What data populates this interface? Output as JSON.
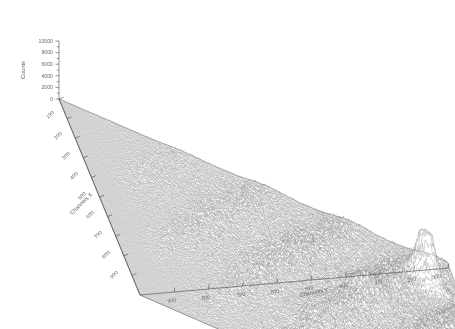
{
  "figure": {
    "kind": "3d-surface-plot",
    "background_color": "#ffffff",
    "ink_color": "#555555"
  },
  "axes": {
    "z": {
      "title": "Counts",
      "ticks": [
        "0",
        "2000",
        "4000",
        "6000",
        "8000",
        "10000"
      ],
      "min": 0,
      "max": 10000
    },
    "x": {
      "title": "Channels X",
      "ticks": [
        "100",
        "200",
        "300",
        "400",
        "500",
        "600",
        "700",
        "800",
        "900"
      ],
      "min": 0,
      "max": 1000
    },
    "y": {
      "title": "Channels Y",
      "ticks": [
        "900",
        "800",
        "700",
        "600",
        "500",
        "400",
        "300",
        "200",
        "100"
      ],
      "min": 0,
      "max": 1000
    }
  },
  "chart_data": {
    "type": "surface",
    "title": "",
    "xlabel": "Channels X",
    "ylabel": "Channels Y",
    "zlabel": "Counts",
    "xlim": [
      0,
      1000
    ],
    "ylim": [
      0,
      1000
    ],
    "zlim": [
      0,
      10000
    ],
    "x_ticks": [
      100,
      200,
      300,
      400,
      500,
      600,
      700,
      800,
      900
    ],
    "y_ticks": [
      900,
      800,
      700,
      600,
      500,
      400,
      300,
      200,
      100
    ],
    "z_ticks": [
      0,
      2000,
      4000,
      6000,
      8000,
      10000
    ],
    "grid": false,
    "legend": "none",
    "colormap": "grayscale",
    "ridge_count": 9,
    "ridge_orientation": "diagonal",
    "peak": {
      "x": 430,
      "y": 200,
      "z": 10000,
      "label": ""
    },
    "noise": "high-frequency spiky noise over whole surface, sparse at low x-y, dense toward high counts"
  }
}
